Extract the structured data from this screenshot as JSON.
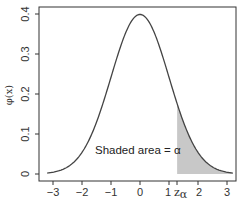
{
  "chart_data": {
    "type": "line",
    "title": "",
    "xlabel": "",
    "ylabel": "φ(x)",
    "xlim": [
      -3.2,
      3.2
    ],
    "ylim": [
      0,
      0.4
    ],
    "grid": false,
    "legend": null,
    "x_ticks": [
      -3,
      -2,
      -1,
      0,
      1,
      2,
      3
    ],
    "x_tick_labels": [
      "−3",
      "−2",
      "−1",
      "0",
      "1",
      "2",
      "3"
    ],
    "y_ticks": [
      0,
      0.1,
      0.2,
      0.3,
      0.4
    ],
    "y_tick_labels": [
      "0",
      "0.1",
      "0.2",
      "0.3",
      "0.4"
    ],
    "series": [
      {
        "name": "Standard normal density φ(x)",
        "function": "exp(-x^2/2)/sqrt(2*pi)",
        "x": [
          -3.2,
          -3,
          -2.5,
          -2,
          -1.5,
          -1,
          -0.5,
          0,
          0.5,
          1,
          1.5,
          2,
          2.5,
          3,
          3.2
        ],
        "values": [
          0.0024,
          0.0044,
          0.0175,
          0.054,
          0.1295,
          0.242,
          0.3521,
          0.3989,
          0.3521,
          0.242,
          0.1295,
          0.054,
          0.0175,
          0.0044,
          0.0024
        ],
        "color": "#444444"
      }
    ],
    "shaded_region": {
      "from": 1.28,
      "to": 3.2,
      "fill": "#c8c8c8",
      "meaning": "upper tail area"
    },
    "annotations": [
      {
        "text_prefix": "Shaded area = ",
        "symbol": "α",
        "x": -1.5,
        "y": 0.055
      },
      {
        "text": "z",
        "subscript": "α",
        "x": 1.28,
        "position": "x-axis tick label"
      }
    ]
  },
  "labels": {
    "ylabel": "φ(x)",
    "annotation_prefix": "Shaded area = ",
    "annotation_symbol": "α",
    "z_main": "z",
    "z_sub": "α",
    "xticks": [
      "−3",
      "−2",
      "−1",
      "0",
      "1",
      "2",
      "3"
    ],
    "yticks": [
      "0",
      "0.1",
      "0.2",
      "0.3",
      "0.4"
    ]
  },
  "colors": {
    "curve": "#444444",
    "shade": "#c8c8c8",
    "axis": "#333333"
  }
}
